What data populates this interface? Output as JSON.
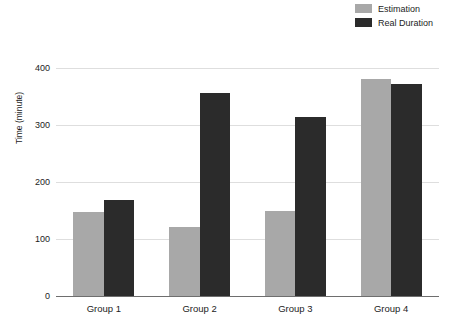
{
  "chart_data": {
    "type": "bar",
    "title": "",
    "xlabel": "",
    "ylabel": "Time (minute)",
    "categories": [
      "Group 1",
      "Group 2",
      "Group 3",
      "Group 4"
    ],
    "series": [
      {
        "name": "Estimation",
        "color": "#a8a8a8",
        "values": [
          147,
          121,
          149,
          382
        ]
      },
      {
        "name": "Real Duration",
        "color": "#2b2b2b",
        "values": [
          168,
          356,
          315,
          373
        ]
      }
    ],
    "ylim": [
      0,
      420
    ],
    "yticks": [
      0,
      100,
      200,
      300,
      400
    ],
    "ytick_labels": [
      "0",
      "100",
      "200",
      "300",
      "400"
    ],
    "grid": true,
    "legend_position": "top-right"
  }
}
